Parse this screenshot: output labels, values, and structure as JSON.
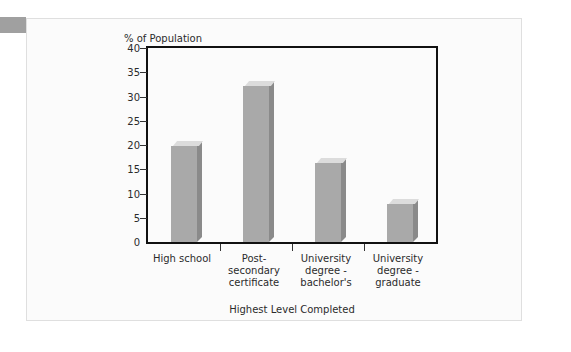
{
  "chart_data": {
    "type": "bar",
    "title": "",
    "subtitle": "",
    "ylabel": "% of Population",
    "xlabel": "Highest Level Completed",
    "categories": [
      "High school",
      "Post-secondary certificate",
      "University degree - bachelor's",
      "University degree - graduate"
    ],
    "category_lines": [
      [
        "High school"
      ],
      [
        "Post-",
        "secondary",
        "certificate"
      ],
      [
        "University",
        "degree -",
        "bachelor's"
      ],
      [
        "University",
        "degree -",
        "graduate"
      ]
    ],
    "values": [
      20,
      32.5,
      16.5,
      8
    ],
    "ylim": [
      0,
      40
    ],
    "ytick_values": [
      0,
      5,
      10,
      15,
      20,
      25,
      30,
      35,
      40
    ],
    "ytick_labels": [
      "0",
      "5",
      "10",
      "15",
      "20",
      "25",
      "30",
      "35",
      "40"
    ],
    "grid": false,
    "legend": "none",
    "style": "3d-bars"
  },
  "colors": {
    "bar_front": "#a9a9a9",
    "bar_top": "#dcdcdc",
    "bar_side": "#8a8a8a",
    "axis": "#111111",
    "text": "#2b2b2b",
    "panel_background": "#fbfbfb",
    "panel_border": "#dfdfdf",
    "corner_tab": "#a0a0a0",
    "page_background": "#ffffff"
  }
}
